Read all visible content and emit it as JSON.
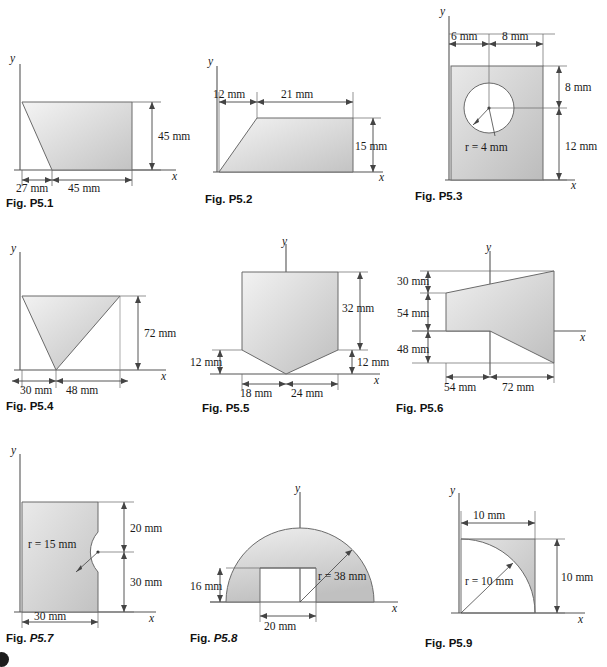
{
  "page": {
    "background_color": "#ffffff",
    "shape_fill_light": "#f2f2f2",
    "shape_fill_dark": "#bdbdbd",
    "line_color": "#4a4a4a",
    "text_color": "#1a1a1a"
  },
  "axis_labels": {
    "x": "x",
    "y": "y"
  },
  "figures": [
    {
      "id": "p5-1",
      "caption_prefix": "Fig.",
      "caption_number": "P5.1",
      "caption_italic": false,
      "shape": "trapezoid",
      "dimensions": [
        {
          "label": "45 mm",
          "orientation": "vertical",
          "value": 45,
          "unit": "mm"
        },
        {
          "label": "27 mm",
          "orientation": "horizontal",
          "value": 27,
          "unit": "mm"
        },
        {
          "label": "45 mm",
          "orientation": "horizontal",
          "value": 45,
          "unit": "mm"
        }
      ]
    },
    {
      "id": "p5-2",
      "caption_prefix": "Fig.",
      "caption_number": "P5.2",
      "caption_italic": false,
      "shape": "trapezoid",
      "dimensions": [
        {
          "label": "12 mm",
          "orientation": "horizontal",
          "value": 12,
          "unit": "mm"
        },
        {
          "label": "21 mm",
          "orientation": "horizontal",
          "value": 21,
          "unit": "mm"
        },
        {
          "label": "15 mm",
          "orientation": "vertical",
          "value": 15,
          "unit": "mm"
        }
      ]
    },
    {
      "id": "p5-3",
      "caption_prefix": "Fig.",
      "caption_number": "P5.3",
      "caption_italic": false,
      "shape": "rectangle-with-circular-hole",
      "dimensions": [
        {
          "label": "6 mm",
          "orientation": "horizontal",
          "value": 6,
          "unit": "mm"
        },
        {
          "label": "8 mm",
          "orientation": "horizontal",
          "value": 8,
          "unit": "mm"
        },
        {
          "label": "8 mm",
          "orientation": "vertical",
          "value": 8,
          "unit": "mm"
        },
        {
          "label": "12 mm",
          "orientation": "vertical",
          "value": 12,
          "unit": "mm"
        },
        {
          "label": "r = 4 mm",
          "orientation": "radius",
          "value": 4,
          "unit": "mm"
        }
      ]
    },
    {
      "id": "p5-4",
      "caption_prefix": "Fig.",
      "caption_number": "P5.4",
      "caption_italic": false,
      "shape": "inverted-triangle",
      "dimensions": [
        {
          "label": "72 mm",
          "orientation": "vertical",
          "value": 72,
          "unit": "mm"
        },
        {
          "label": "30 mm",
          "orientation": "horizontal",
          "value": 30,
          "unit": "mm"
        },
        {
          "label": "48 mm",
          "orientation": "horizontal",
          "value": 48,
          "unit": "mm"
        }
      ]
    },
    {
      "id": "p5-5",
      "caption_prefix": "Fig.",
      "caption_number": "P5.5",
      "caption_italic": false,
      "shape": "pentagon-rectangle-with-triangular-bottom",
      "dimensions": [
        {
          "label": "32 mm",
          "orientation": "vertical",
          "value": 32,
          "unit": "mm"
        },
        {
          "label": "12 mm",
          "orientation": "vertical",
          "value": 12,
          "unit": "mm"
        },
        {
          "label": "12 mm",
          "orientation": "vertical",
          "value": 12,
          "unit": "mm"
        },
        {
          "label": "18 mm",
          "orientation": "horizontal",
          "value": 18,
          "unit": "mm"
        },
        {
          "label": "24 mm",
          "orientation": "horizontal",
          "value": 24,
          "unit": "mm"
        }
      ]
    },
    {
      "id": "p5-6",
      "caption_prefix": "Fig.",
      "caption_number": "P5.6",
      "caption_italic": false,
      "shape": "quadrilateral-across-axis",
      "dimensions": [
        {
          "label": "30 mm",
          "orientation": "vertical",
          "value": 30,
          "unit": "mm"
        },
        {
          "label": "54 mm",
          "orientation": "vertical",
          "value": 54,
          "unit": "mm"
        },
        {
          "label": "48 mm",
          "orientation": "vertical",
          "value": 48,
          "unit": "mm"
        },
        {
          "label": "54 mm",
          "orientation": "horizontal",
          "value": 54,
          "unit": "mm"
        },
        {
          "label": "72 mm",
          "orientation": "horizontal",
          "value": 72,
          "unit": "mm"
        }
      ]
    },
    {
      "id": "p5-7",
      "caption_prefix": "Fig.",
      "caption_number": "P5.7",
      "caption_italic": true,
      "shape": "rectangle-with-semicircular-notch",
      "dimensions": [
        {
          "label": "r = 15 mm",
          "orientation": "radius",
          "value": 15,
          "unit": "mm"
        },
        {
          "label": "20 mm",
          "orientation": "vertical",
          "value": 20,
          "unit": "mm"
        },
        {
          "label": "30 mm",
          "orientation": "vertical",
          "value": 30,
          "unit": "mm"
        },
        {
          "label": "30 mm",
          "orientation": "horizontal",
          "value": 30,
          "unit": "mm"
        }
      ]
    },
    {
      "id": "p5-8",
      "caption_prefix": "Fig.",
      "caption_number": "P5.8",
      "caption_italic": true,
      "shape": "semicircle-with-rectangular-notch",
      "dimensions": [
        {
          "label": "r = 38 mm",
          "orientation": "radius",
          "value": 38,
          "unit": "mm"
        },
        {
          "label": "16 mm",
          "orientation": "vertical",
          "value": 16,
          "unit": "mm"
        },
        {
          "label": "20 mm",
          "orientation": "horizontal",
          "value": 20,
          "unit": "mm"
        }
      ]
    },
    {
      "id": "p5-9",
      "caption_prefix": "Fig.",
      "caption_number": "P5.9",
      "caption_italic": false,
      "shape": "quarter-circle-spandrel",
      "dimensions": [
        {
          "label": "10 mm",
          "orientation": "horizontal",
          "value": 10,
          "unit": "mm"
        },
        {
          "label": "10 mm",
          "orientation": "vertical",
          "value": 10,
          "unit": "mm"
        },
        {
          "label": "r = 10 mm",
          "orientation": "radius",
          "value": 10,
          "unit": "mm"
        }
      ]
    }
  ]
}
